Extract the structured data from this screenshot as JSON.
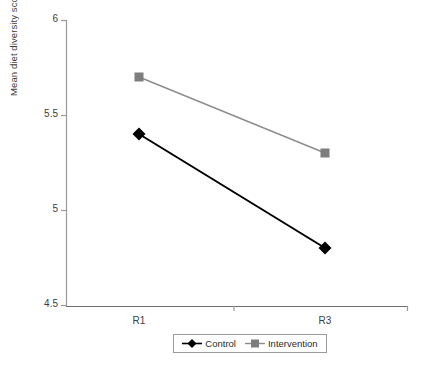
{
  "chart_data": {
    "type": "line",
    "title": "",
    "xlabel": "",
    "ylabel": "Mean diet diversity score",
    "categories": [
      "R1",
      "R3"
    ],
    "ylim": [
      4.5,
      6
    ],
    "yticks": [
      "4.5",
      "5",
      "5.5",
      "6"
    ],
    "ytick_values": [
      4.5,
      5,
      5.5,
      6
    ],
    "grid": false,
    "legend_position": "bottom",
    "series": [
      {
        "name": "Control",
        "values": [
          5.4,
          4.8
        ],
        "color": "#000000",
        "marker": "diamond"
      },
      {
        "name": "Intervention",
        "values": [
          5.7,
          5.3
        ],
        "color": "#808080",
        "marker": "square"
      }
    ]
  },
  "axis": {
    "y_title": "Mean diet diversity score",
    "y_ticks": [
      {
        "label": "6",
        "value": 6
      },
      {
        "label": "5.5",
        "value": 5.5
      },
      {
        "label": "5",
        "value": 5
      },
      {
        "label": "4.5",
        "value": 4.5
      }
    ],
    "x_ticks": [
      {
        "label": "R1"
      },
      {
        "label": "R3"
      }
    ]
  },
  "legend": {
    "items": [
      {
        "label": "Control",
        "color": "#000000",
        "marker": "diamond-marker"
      },
      {
        "label": "Intervention",
        "color": "#808080",
        "marker": "square-marker"
      }
    ]
  },
  "caption": {
    "text": ""
  }
}
